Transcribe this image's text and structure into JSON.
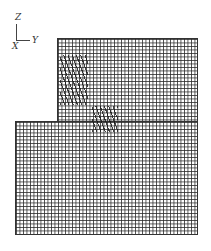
{
  "axes": {
    "vertical_label": "Z",
    "horizontal_label": "Y",
    "origin_label": "X"
  },
  "mesh": {
    "upper_block": {
      "x": 57,
      "y": 38,
      "w": 141,
      "h": 84
    },
    "lower_block": {
      "x": 15,
      "y": 121,
      "w": 183,
      "h": 114
    },
    "hatched_regions": [
      {
        "name": "upper-hatch",
        "x": 60,
        "y": 55,
        "w": 28,
        "h": 50
      },
      {
        "name": "middle-hatch",
        "x": 92,
        "y": 106,
        "w": 26,
        "h": 26
      }
    ],
    "line_color": "#282828"
  }
}
